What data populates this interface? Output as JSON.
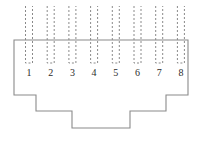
{
  "diagram": {
    "type": "connector-pinout-outline",
    "colors": {
      "line": "#8a8a8a",
      "body_line": "#8a8a8a",
      "text": "#2b2b2b",
      "background": "#ffffff"
    },
    "pins": {
      "count": 8,
      "labels": [
        "1",
        "2",
        "3",
        "4",
        "5",
        "6",
        "7",
        "8"
      ],
      "label_y": 72,
      "first_center_x": 29,
      "spacing_x": 21.7,
      "channel_width": 7,
      "top_y": 6,
      "bottom_y": 63,
      "stroke_style": "dashed"
    },
    "body": {
      "left_x": 14,
      "right_x": 188,
      "top_y": 40,
      "shoulder_y": 95,
      "step1_y": 111,
      "bottom_y": 128,
      "step1_left_x": 36,
      "step1_right_x": 166,
      "step2_left_x": 72,
      "step2_right_x": 130,
      "outline_path": "M 14 40 L 188 40 L 188 95 L 166 95 L 166 111 L 130 111 L 130 128 L 72 128 L 72 111 L 36 111 L 36 95 L 14 95 Z"
    }
  }
}
